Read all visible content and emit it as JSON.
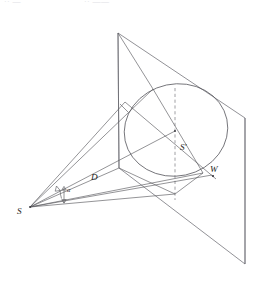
{
  "figure": {
    "background_color": "#ffffff",
    "line_color": "#5a5a5e",
    "label_color": "#1d1d20",
    "labels": {
      "apex": "S",
      "angle": "α",
      "distance": "D",
      "projected_point": "S′",
      "width": "W"
    },
    "clipped_header": {
      "left_fragment": "·· —",
      "right_fragment": "·· ——"
    }
  },
  "geometry": {
    "plane": {
      "name": "projection-plane",
      "type": "parallelogram",
      "corners": [
        [
          118,
          33
        ],
        [
          245,
          118
        ],
        [
          245,
          264
        ],
        [
          119,
          168
        ]
      ]
    },
    "ellipse": {
      "name": "cone-base-ellipse",
      "center": [
        176,
        130
      ],
      "rx": 52,
      "ry": 46,
      "rotation_deg": -12
    },
    "apex": [
      30,
      207
    ],
    "projected_center": [
      175,
      131
    ],
    "dashed_axis": {
      "x": 175,
      "y_top": 88,
      "y_bottom": 200
    },
    "cone_generators": [
      [
        [
          30,
          207
        ],
        [
          153,
          89
        ]
      ],
      [
        [
          30,
          207
        ],
        [
          203,
          173
        ]
      ],
      [
        [
          30,
          207
        ],
        [
          125,
          102
        ]
      ],
      [
        [
          30,
          207
        ],
        [
          175,
          131
        ]
      ],
      [
        [
          30,
          207
        ],
        [
          175,
          194
        ]
      ]
    ],
    "chord_major": [
      [
        125,
        102
      ],
      [
        212,
        175
      ]
    ],
    "chord_axis": [
      [
        153,
        89
      ],
      [
        203,
        173
      ]
    ],
    "angle_arc": {
      "center": [
        30,
        207
      ],
      "radius": 33,
      "from_deg": -44,
      "to_deg": -18
    }
  }
}
